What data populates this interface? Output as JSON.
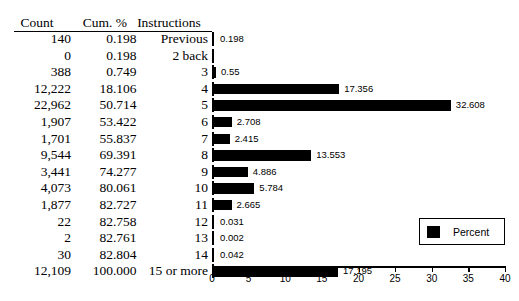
{
  "table": {
    "headers": [
      "Count",
      "Cum. %",
      "Instructions"
    ],
    "rows": [
      {
        "count": "140",
        "cum": "0.198",
        "instr": "Previous"
      },
      {
        "count": "0",
        "cum": "0.198",
        "instr": "2 back"
      },
      {
        "count": "388",
        "cum": "0.749",
        "instr": "3"
      },
      {
        "count": "12,222",
        "cum": "18.106",
        "instr": "4"
      },
      {
        "count": "22,962",
        "cum": "50.714",
        "instr": "5"
      },
      {
        "count": "1,907",
        "cum": "53.422",
        "instr": "6"
      },
      {
        "count": "1,701",
        "cum": "55.837",
        "instr": "7"
      },
      {
        "count": "9,544",
        "cum": "69.391",
        "instr": "8"
      },
      {
        "count": "3,441",
        "cum": "74.277",
        "instr": "9"
      },
      {
        "count": "4,073",
        "cum": "80.061",
        "instr": "10"
      },
      {
        "count": "1,877",
        "cum": "82.727",
        "instr": "11"
      },
      {
        "count": "22",
        "cum": "82.758",
        "instr": "12"
      },
      {
        "count": "2",
        "cum": "82.761",
        "instr": "13"
      },
      {
        "count": "30",
        "cum": "82.804",
        "instr": "14"
      },
      {
        "count": "12,109",
        "cum": "100.000",
        "instr": "15 or more"
      }
    ]
  },
  "chart_data": {
    "type": "bar",
    "orientation": "horizontal",
    "title": "",
    "xlabel": "",
    "ylabel": "",
    "xlim": [
      0,
      40
    ],
    "xticks": [
      0,
      5,
      10,
      15,
      20,
      25,
      30,
      35,
      40
    ],
    "xtick_labels": [
      "0",
      "5",
      "10",
      "15",
      "20",
      "25",
      "30",
      "35",
      "40"
    ],
    "grid": false,
    "legend": {
      "position": "lower-right",
      "entries": [
        "Percent"
      ]
    },
    "series_name": "Percent",
    "bar_color": "#000000",
    "categories": [
      "Previous",
      "2 back",
      "3",
      "4",
      "5",
      "6",
      "7",
      "8",
      "9",
      "10",
      "11",
      "12",
      "13",
      "14",
      "15 or more"
    ],
    "values": [
      0.198,
      0,
      0.55,
      17.356,
      32.608,
      2.708,
      2.415,
      13.553,
      4.886,
      5.784,
      2.665,
      0.031,
      0.002,
      0.042,
      17.195
    ],
    "data_labels": [
      "0.198",
      "",
      "0.55",
      "17.356",
      "32.608",
      "2.708",
      "2.415",
      "13.553",
      "4.886",
      "5.784",
      "2.665",
      "0.031",
      "0.002",
      "0.042",
      "17.195"
    ]
  },
  "legend": {
    "label": "Percent",
    "swatch_color": "#000000"
  },
  "caption": ""
}
